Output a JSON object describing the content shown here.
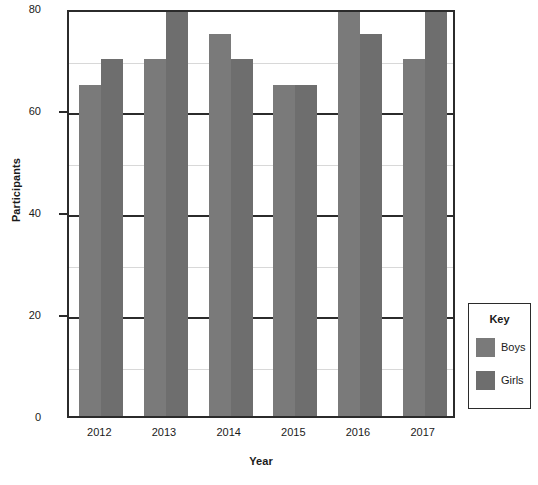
{
  "chart_data": {
    "type": "bar",
    "title": "",
    "xlabel": "Year",
    "ylabel": "Participants",
    "categories": [
      "2012",
      "2013",
      "2014",
      "2015",
      "2016",
      "2017"
    ],
    "series": [
      {
        "name": "Boys",
        "color": "#7a7a7a",
        "values": [
          65,
          70,
          75,
          65,
          80,
          70
        ]
      },
      {
        "name": "Girls",
        "color": "#6e6e6e",
        "values": [
          70,
          80,
          70,
          65,
          75,
          80
        ]
      }
    ],
    "ylim": [
      0,
      80
    ],
    "ytick_labels": [
      "0",
      "20",
      "40",
      "60",
      "80"
    ],
    "ytick_values": [
      0,
      20,
      40,
      60,
      80
    ],
    "minor_gridline_values": [
      10,
      30,
      50,
      70
    ],
    "grid": true,
    "legend_position": "right-outside"
  },
  "legend": {
    "title": "Key",
    "entries": [
      {
        "label": "Boys",
        "color": "#7a7a7a"
      },
      {
        "label": "Girls",
        "color": "#6e6e6e"
      }
    ]
  },
  "colors": {
    "axis": "#2b2b2b",
    "minor_grid": "#d8d8d8",
    "background": "#ffffff",
    "text": "#1a1a1a"
  }
}
